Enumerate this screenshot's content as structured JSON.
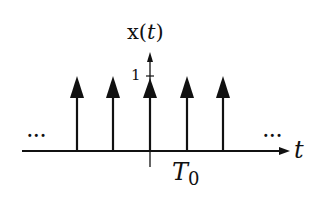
{
  "diagram": {
    "title_label": "x(",
    "title_var": "t",
    "title_close": ")",
    "tick_label": "1",
    "period_label": "T",
    "period_subscript": "0",
    "time_axis_label": "t",
    "ellipsis_left": "...",
    "ellipsis_right": "...",
    "impulse_count": 5,
    "impulse_height": 1,
    "line_color": "#111111",
    "background": "#ffffff"
  }
}
